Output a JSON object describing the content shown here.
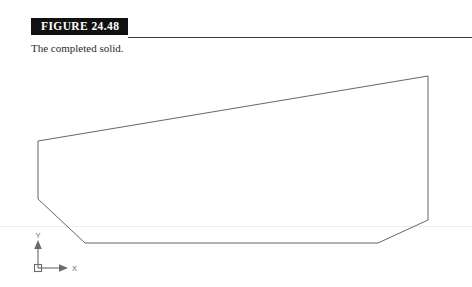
{
  "figure": {
    "banner_label": "FIGURE 24.48",
    "caption": "The completed solid."
  },
  "ucs_icon": {
    "x_label": "X",
    "y_label": "Y",
    "origin": {
      "x": 38,
      "y": 268
    }
  },
  "drawing": {
    "title": "completed solid profile",
    "stroke_color": "#555555",
    "background": "#ffffff",
    "solid_outline": {
      "closed": true,
      "vertices": [
        {
          "name": "top-left",
          "x": 38,
          "y": 141
        },
        {
          "name": "top-right",
          "x": 428,
          "y": 76
        },
        {
          "name": "right-lower",
          "x": 428,
          "y": 220
        },
        {
          "name": "bottom-right-chamfer",
          "x": 378,
          "y": 243
        },
        {
          "name": "bottom-left-chamfer",
          "x": 85,
          "y": 243
        },
        {
          "name": "left-lower",
          "x": 38,
          "y": 199
        }
      ]
    }
  }
}
